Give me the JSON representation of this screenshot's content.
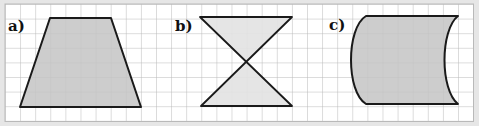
{
  "figures": [
    {
      "label": "a)",
      "shape": "trapezoid",
      "fill": "#c4c4c4"
    },
    {
      "label": "b)",
      "shape": "hourglass",
      "fill": "#e2e2e2"
    },
    {
      "label": "c)",
      "shape": "curved-quadrilateral",
      "fill": "#c4c4c4"
    }
  ],
  "colors": {
    "background": "#e6e6e6",
    "grid_bg": "#ffffff",
    "grid_line": "#b9b9b9",
    "outline": "#1a1a1a"
  }
}
